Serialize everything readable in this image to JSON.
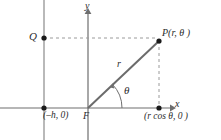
{
  "figure": {
    "colors": {
      "axis": "#6e6e6e",
      "directrix": "#8a8a8a",
      "radius": "#6b6b6b",
      "dashed": "#9a9a9a",
      "point": "#1a1a1a",
      "text": "#2b2b2b",
      "background": "#ffffff"
    },
    "labels": {
      "point_q": "Q",
      "point_p": "P(r, θ )",
      "radius": "r",
      "angle": "θ",
      "axis_x": "x",
      "axis_y": "y",
      "directrix_point": "(–h, 0)",
      "focus": "F",
      "foot_point": "(r cos θ, 0 )"
    },
    "geometry": {
      "origin": [
        88,
        108
      ],
      "point_p": [
        159,
        41
      ],
      "point_q": [
        44,
        38
      ],
      "point_directrix": [
        44,
        108
      ],
      "point_foot": [
        159,
        108
      ],
      "x_axis_y": 108,
      "y_axis_x": 88,
      "directrix_x": 44,
      "angle_degrees": 43
    }
  }
}
